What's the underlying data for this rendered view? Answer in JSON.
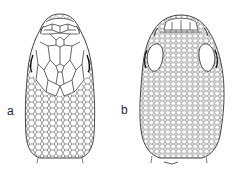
{
  "figure": {
    "panels": [
      {
        "label": "a",
        "subject": "lizard head, dorsal view, large head shields"
      },
      {
        "label": "b",
        "subject": "lizard head, dorsal view, small granular scales"
      }
    ],
    "colors": {
      "line": "#3a3a3a",
      "background": "#ffffff"
    }
  }
}
